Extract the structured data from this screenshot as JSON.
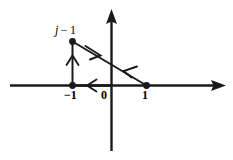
{
  "figure": {
    "background_color": "#ffffff",
    "stroke_color": "#1a1a1a",
    "width": 233,
    "height": 160
  },
  "axes": {
    "x_axis": {
      "name": "real-axis",
      "y": 85,
      "x_start": 10,
      "x_end": 226,
      "arrow": "right"
    },
    "y_axis": {
      "name": "imaginary-axis",
      "x": 111,
      "y_start": 151,
      "y_end": 9,
      "arrow": "up"
    },
    "origin": {
      "x": 111,
      "y": 85
    }
  },
  "labels": {
    "vertex_top": {
      "symbol": "j",
      "operator": " − ",
      "number": "1"
    },
    "tick_neg_one": "−1",
    "tick_zero": "0",
    "tick_one": "1"
  },
  "points": [
    {
      "name": "point-j-minus-1",
      "label": "j − 1",
      "x": 72,
      "y": 41
    },
    {
      "name": "point-neg-one",
      "label": "−1",
      "x": 72,
      "y": 85
    },
    {
      "name": "point-one",
      "label": "1",
      "x": 146,
      "y": 85
    }
  ],
  "contour": {
    "type": "closed-triangle",
    "direction": "counterclockwise",
    "segments": [
      {
        "name": "segment-vertical-up",
        "from": {
          "x": 72,
          "y": 85
        },
        "to": {
          "x": 72,
          "y": 41
        },
        "arrow_direction": "up",
        "arrow_at": {
          "x": 72,
          "y": 58
        }
      },
      {
        "name": "segment-diagonal-down-right",
        "from": {
          "x": 72,
          "y": 41
        },
        "to": {
          "x": 146,
          "y": 85
        },
        "arrow_direction": "down-right",
        "arrow_at": {
          "x": 95,
          "y": 55
        }
      },
      {
        "name": "segment-diagonal-up-left",
        "from": {
          "x": 146,
          "y": 85
        },
        "to": {
          "x": 72,
          "y": 41
        },
        "arrow_direction": "up-left",
        "arrow_at": {
          "x": 129,
          "y": 75
        }
      },
      {
        "name": "segment-horizontal-left",
        "from": {
          "x": 111,
          "y": 85
        },
        "to": {
          "x": 72,
          "y": 85
        },
        "arrow_direction": "left",
        "arrow_at": {
          "x": 91,
          "y": 85
        }
      }
    ]
  }
}
